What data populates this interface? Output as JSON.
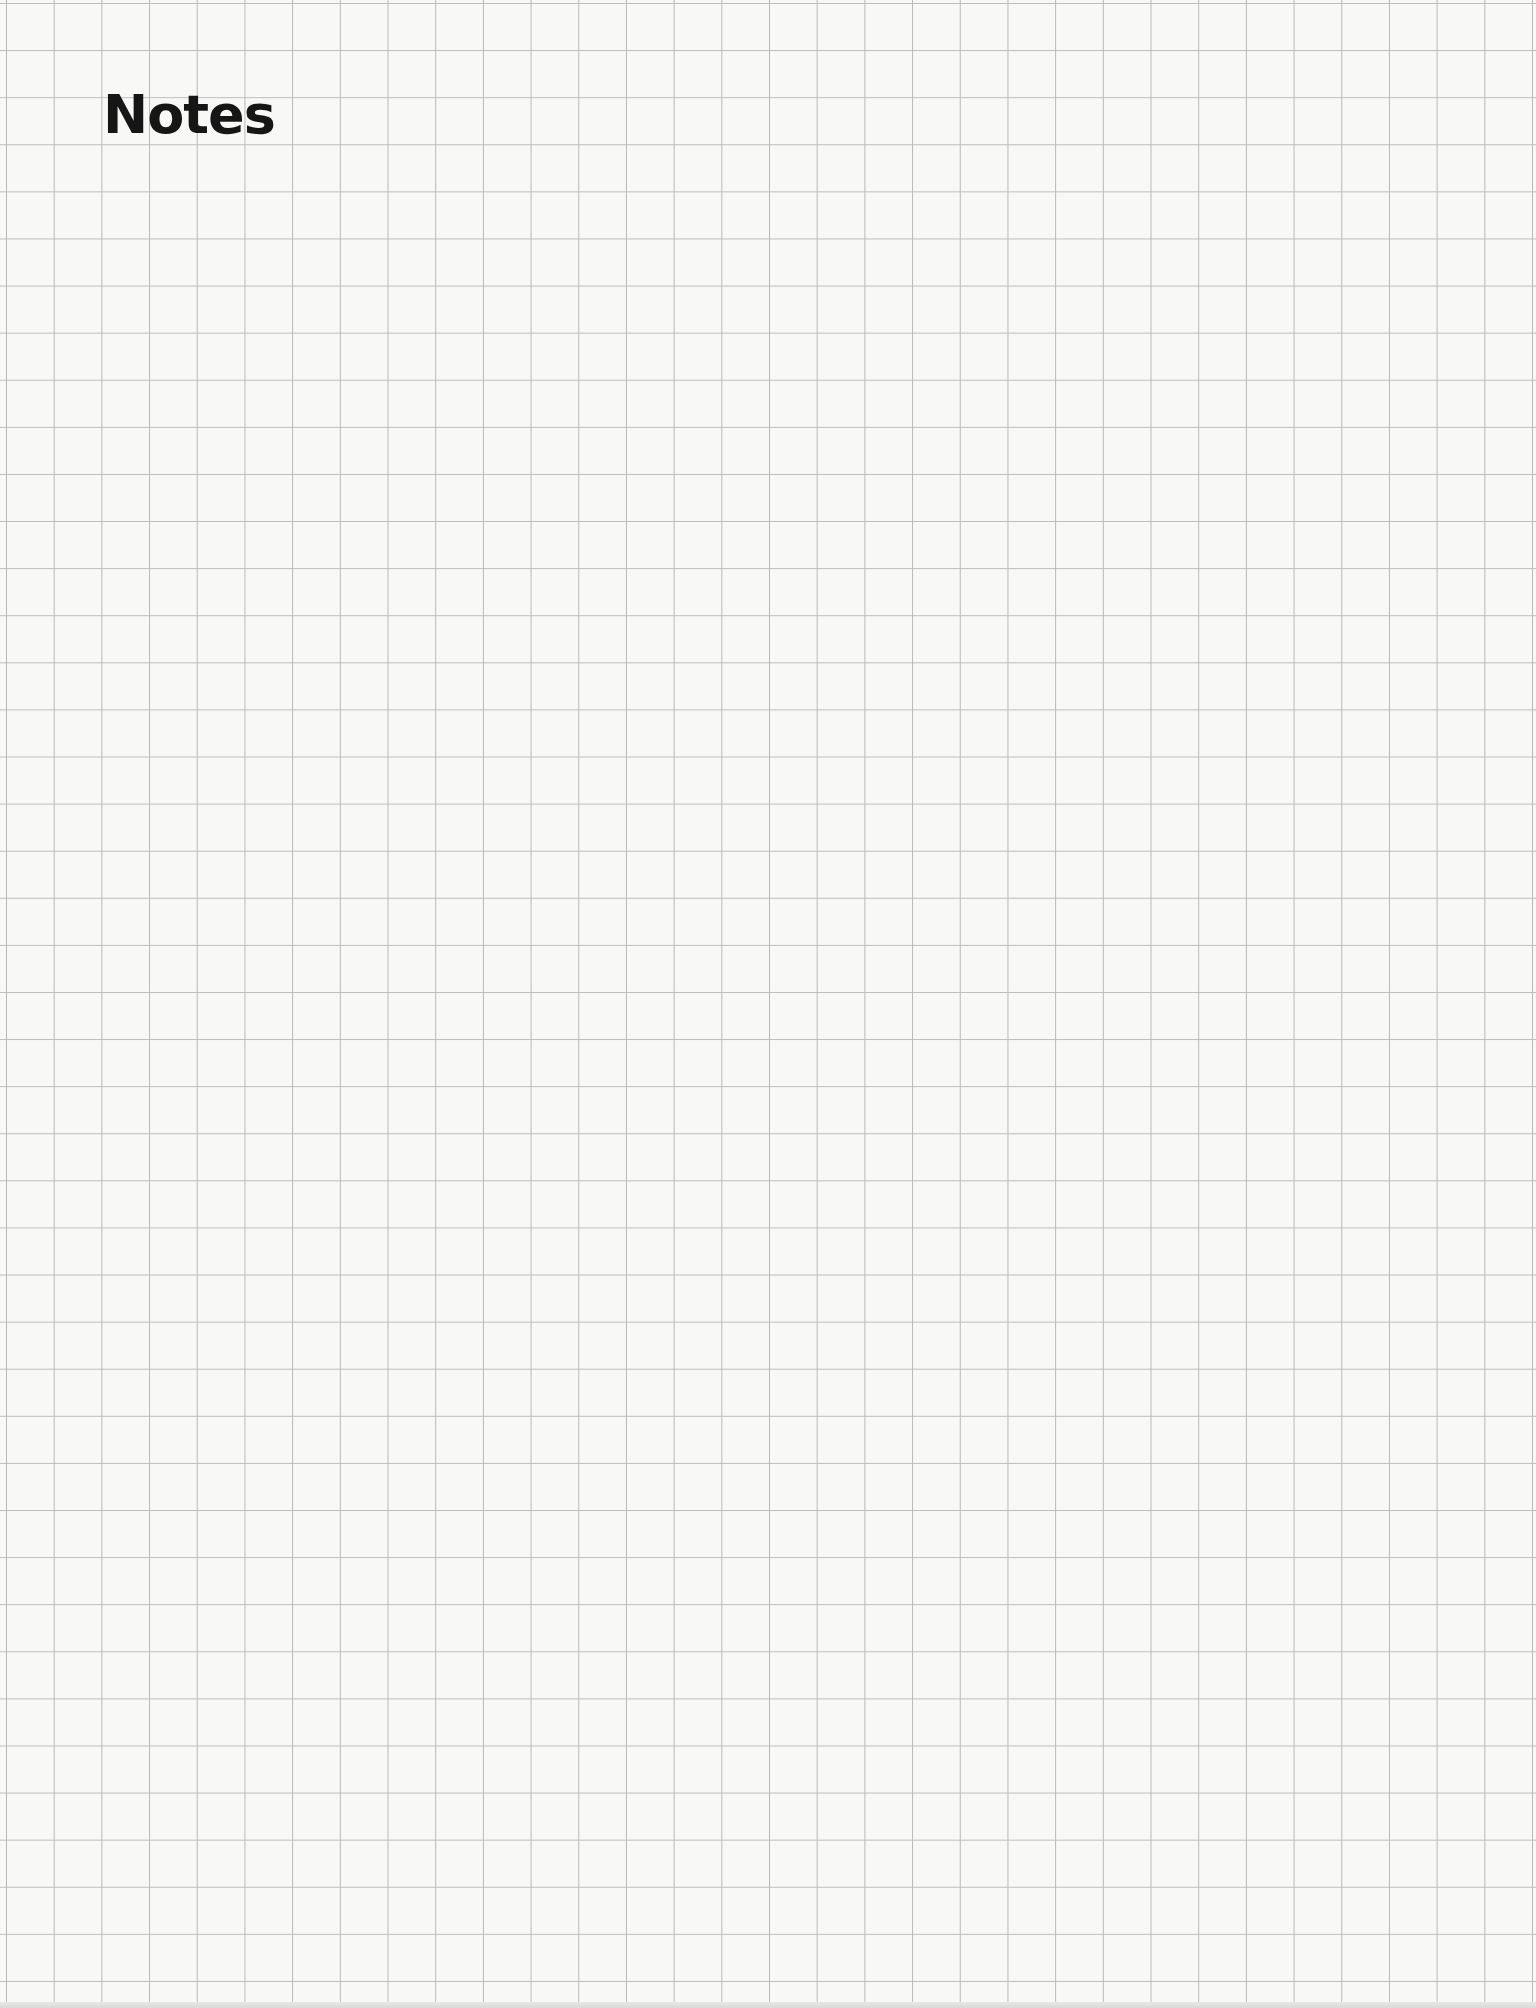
{
  "page": {
    "title": "Notes",
    "style": "grid-paper",
    "colors": {
      "background": "#f8f8f7",
      "grid_line": "#bbbbbb",
      "title_text": "#161616"
    }
  }
}
